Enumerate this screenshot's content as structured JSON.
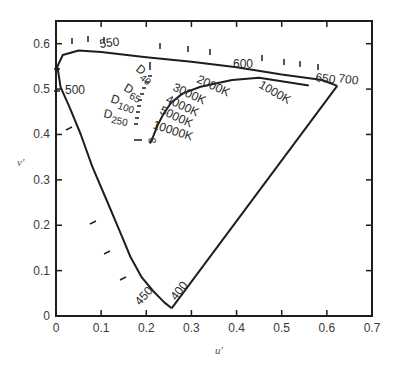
{
  "chart_data": {
    "type": "line",
    "title": "",
    "xlabel": "u'",
    "ylabel": "v'",
    "xlim": [
      0,
      0.7
    ],
    "ylim": [
      0,
      0.65
    ],
    "grid": false,
    "x_ticks": [
      "0",
      "0.1",
      "0.2",
      "0.3",
      "0.4",
      "0.5",
      "0.6",
      "0.7"
    ],
    "y_ticks": [
      "0",
      "0.1",
      "0.2",
      "0.3",
      "0.4",
      "0.5",
      "0.6"
    ],
    "series": [
      {
        "name": "spectral locus",
        "points": [
          [
            0.256,
            0.017
          ],
          [
            0.24,
            0.03
          ],
          [
            0.215,
            0.055
          ],
          [
            0.19,
            0.085
          ],
          [
            0.165,
            0.13
          ],
          [
            0.14,
            0.19
          ],
          [
            0.11,
            0.26
          ],
          [
            0.08,
            0.33
          ],
          [
            0.055,
            0.4
          ],
          [
            0.03,
            0.46
          ],
          [
            0.01,
            0.505
          ],
          [
            0.003,
            0.55
          ],
          [
            0.015,
            0.575
          ],
          [
            0.05,
            0.585
          ],
          [
            0.1,
            0.582
          ],
          [
            0.2,
            0.57
          ],
          [
            0.3,
            0.56
          ],
          [
            0.4,
            0.548
          ],
          [
            0.5,
            0.532
          ],
          [
            0.59,
            0.52
          ],
          [
            0.623,
            0.507
          ]
        ]
      },
      {
        "name": "purple line",
        "points": [
          [
            0.623,
            0.507
          ],
          [
            0.256,
            0.017
          ]
        ]
      },
      {
        "name": "Planckian locus",
        "points": [
          [
            0.56,
            0.508
          ],
          [
            0.45,
            0.525
          ],
          [
            0.39,
            0.52
          ],
          [
            0.32,
            0.505
          ],
          [
            0.28,
            0.49
          ],
          [
            0.255,
            0.47
          ],
          [
            0.238,
            0.445
          ],
          [
            0.225,
            0.42
          ],
          [
            0.215,
            0.395
          ],
          [
            0.208,
            0.38
          ]
        ]
      }
    ],
    "annotations": {
      "wavelengths": [
        "400",
        "450",
        "500",
        "550",
        "600",
        "650",
        "700"
      ],
      "color_temperatures": [
        "1000K",
        "2000K",
        "3000K",
        "4000K",
        "5000K",
        "10000K",
        "∞"
      ],
      "daylight": [
        {
          "main": "D",
          "sub": "40"
        },
        {
          "main": "D",
          "sub": "65"
        },
        {
          "main": "D",
          "sub": "100"
        },
        {
          "main": "D",
          "sub": "250"
        }
      ]
    }
  }
}
